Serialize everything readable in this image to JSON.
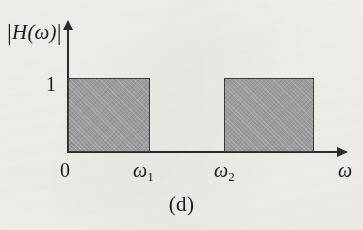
{
  "figure": {
    "caption": "(d)",
    "background_color": "#f4f2ef",
    "ink_color": "#2a2a2a",
    "band_fill_color": "#9b9b9b",
    "band_border_color": "#3a3a3a"
  },
  "axes": {
    "y_label_open_bar": "|",
    "y_label_text": "H(ω)",
    "y_label_close_bar": "|",
    "y_label_full": "|H(ω)|",
    "y_tick_label": "1",
    "x_origin_label": "0",
    "x_tick_1_symbol": "ω",
    "x_tick_1_subscript": "1",
    "x_tick_2_symbol": "ω",
    "x_tick_2_subscript": "2",
    "x_axis_variable": "ω",
    "y_arrow": "up-arrow",
    "x_arrow": "right-arrow"
  },
  "chart_data": {
    "type": "area",
    "title": "(d)",
    "xlabel": "ω",
    "ylabel": "|H(ω)|",
    "xlim": [
      0,
      1.22
    ],
    "ylim": [
      0,
      1.25
    ],
    "grid": false,
    "legend": null,
    "x_tick_labels": [
      "0",
      "ω₁",
      "ω₂",
      "ω"
    ],
    "x_tick_values": [
      0,
      0.3,
      0.58,
      1.15
    ],
    "y_tick_labels": [
      "1"
    ],
    "y_tick_values": [
      1
    ],
    "series": [
      {
        "name": "|H(ω)|",
        "shape": "rectangular-passbands",
        "segments": [
          {
            "x_start": 0,
            "x_end": 0.3,
            "y": 1,
            "label": "0 to ω₁"
          },
          {
            "x_start": 0.3,
            "x_end": 0.58,
            "y": 0,
            "label": "ω₁ to ω₂"
          },
          {
            "x_start": 0.58,
            "x_end": 0.9,
            "y": 1,
            "label": "ω₂ onward"
          }
        ]
      }
    ]
  }
}
